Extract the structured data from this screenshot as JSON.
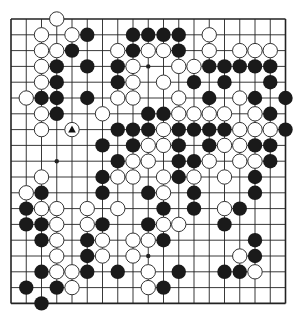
{
  "board": {
    "size": 19,
    "origin_x": 11,
    "origin_y": 19,
    "spacing_x": 15.25,
    "spacing_y": 15.8,
    "line_color": "#222222",
    "black_color": "#1a1a1a",
    "white_fill": "#ffffff",
    "white_stroke": "#333333",
    "star_points": [
      [
        3,
        3
      ],
      [
        3,
        9
      ],
      [
        3,
        15
      ],
      [
        9,
        3
      ],
      [
        9,
        9
      ],
      [
        9,
        15
      ],
      [
        15,
        3
      ],
      [
        15,
        9
      ],
      [
        15,
        15
      ]
    ],
    "last_move_marker": {
      "row": 7,
      "col": 4,
      "color": "white",
      "shape": "triangle"
    }
  },
  "stones": {
    "rows": [
      {
        "row": 0,
        "black": [],
        "white": [
          3
        ]
      },
      {
        "row": 1,
        "black": [
          5,
          8,
          9,
          10,
          11
        ],
        "white": [
          2,
          4,
          13
        ]
      },
      {
        "row": 2,
        "black": [
          4,
          8,
          11
        ],
        "white": [
          2,
          3,
          7,
          9,
          10,
          13,
          15,
          16,
          17
        ]
      },
      {
        "row": 3,
        "black": [
          3,
          5,
          7,
          13,
          14,
          15,
          16,
          17
        ],
        "white": [
          2,
          8,
          11,
          12
        ]
      },
      {
        "row": 4,
        "black": [
          3,
          7,
          12,
          14,
          17
        ],
        "white": [
          2,
          8,
          10
        ]
      },
      {
        "row": 5,
        "black": [
          2,
          3,
          5,
          13,
          16,
          18
        ],
        "white": [
          1,
          7,
          8,
          11,
          15
        ]
      },
      {
        "row": 6,
        "black": [
          3,
          9,
          10,
          17
        ],
        "white": [
          2,
          6,
          11,
          12,
          13,
          14,
          16
        ]
      },
      {
        "row": 7,
        "black": [
          7,
          8,
          9,
          11,
          12,
          13,
          14,
          18
        ],
        "white": [
          2,
          4,
          10,
          15,
          16,
          17
        ]
      },
      {
        "row": 8,
        "black": [
          6,
          8,
          11,
          13,
          16,
          17
        ],
        "white": [
          9,
          10,
          14,
          15
        ]
      },
      {
        "row": 9,
        "black": [
          7,
          11,
          12,
          17
        ],
        "white": [
          8,
          9,
          13,
          15,
          16
        ]
      },
      {
        "row": 10,
        "black": [
          6,
          11,
          16
        ],
        "white": [
          2,
          7,
          8,
          10,
          12,
          14
        ]
      },
      {
        "row": 11,
        "black": [
          2,
          6,
          9,
          12,
          16
        ],
        "white": [
          1,
          10
        ]
      },
      {
        "row": 12,
        "black": [
          1,
          10,
          12,
          15
        ],
        "white": [
          2,
          3,
          5,
          7,
          14
        ]
      },
      {
        "row": 13,
        "black": [
          1,
          2,
          6,
          9,
          14
        ],
        "white": [
          3,
          5,
          10,
          11
        ]
      },
      {
        "row": 14,
        "black": [
          2,
          5,
          10,
          16
        ],
        "white": [
          3,
          6,
          8,
          9
        ]
      },
      {
        "row": 15,
        "black": [
          5,
          16
        ],
        "white": [
          3,
          6,
          8,
          15
        ]
      },
      {
        "row": 16,
        "black": [
          2,
          5,
          7,
          11,
          14,
          15
        ],
        "white": [
          3,
          4,
          9,
          16
        ]
      },
      {
        "row": 17,
        "black": [
          1,
          3,
          10
        ],
        "white": [
          4,
          9
        ]
      },
      {
        "row": 18,
        "black": [
          2
        ],
        "white": []
      }
    ]
  }
}
